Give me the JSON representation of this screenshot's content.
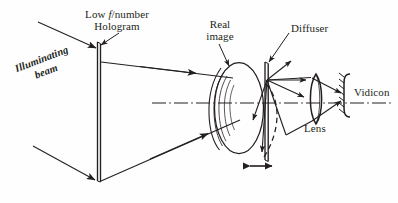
{
  "figure": {
    "background_color": "#fefefe",
    "ink_color": "#231f20",
    "width": 398,
    "height": 203
  },
  "labels": {
    "hologram_line1_pre": "Low ",
    "hologram_line1_italic": "f",
    "hologram_line1_post": "/number",
    "hologram_line2": "Hologram",
    "illuminating_line1": "Illuminating",
    "illuminating_line2": "beam",
    "real_image_line1": "Real",
    "real_image_line2": "image",
    "diffuser": "Diffuser",
    "lens": "Lens",
    "vidicon": "Vidicon"
  },
  "components": [
    {
      "name": "hologram-plate",
      "kind": "plate",
      "x": 97,
      "y_top": 42,
      "y_bottom": 181
    },
    {
      "name": "real-image",
      "kind": "ellipse-object",
      "cx": 239,
      "cy": 108,
      "rx": 24,
      "ry": 45
    },
    {
      "name": "diffuser-plate",
      "kind": "plate",
      "x": 266,
      "y_top": 62,
      "y_bottom": 160
    },
    {
      "name": "diffuser-dashed-arc",
      "kind": "dashed-arc"
    },
    {
      "name": "imaging-lens",
      "kind": "biconvex-lens",
      "cx": 316,
      "cy": 99,
      "half_height": 25
    },
    {
      "name": "vidicon-detector",
      "kind": "bracket-hatched",
      "x": 344,
      "cy": 96
    },
    {
      "name": "optical-axis",
      "kind": "dash-dot-line",
      "y": 103
    },
    {
      "name": "diffuser-translation-arrow",
      "kind": "double-arrow",
      "y": 166
    }
  ],
  "rays": {
    "illuminating_beams": 2,
    "reconstructed_beams": 2,
    "scatter_rays_from_diffuser": 4,
    "collected_rays_to_vidicon": 2
  }
}
